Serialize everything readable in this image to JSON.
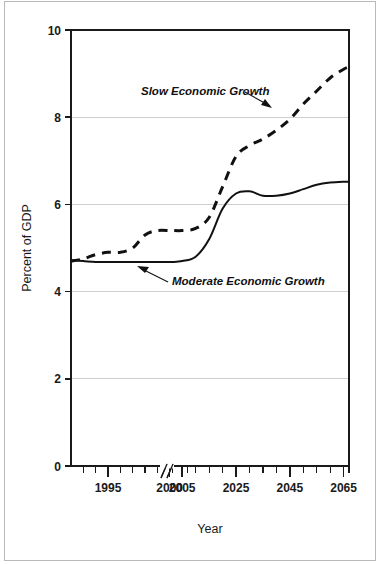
{
  "figure": {
    "background_color": "#ffffff",
    "frame_color": "#b9b9b9"
  },
  "chart_data": {
    "type": "line",
    "title": "",
    "subtitle": "",
    "xlabel": "Year",
    "ylabel": "Percent of GDP",
    "xlim": [
      1992,
      2067
    ],
    "ylim": [
      0,
      10
    ],
    "yticks": [
      0,
      2,
      4,
      6,
      8,
      10
    ],
    "ytick_labels": [
      "0",
      "2",
      "4",
      "6",
      "8",
      "10"
    ],
    "xtick_labels": [
      "1995",
      "2000",
      "2005",
      "2025",
      "2045",
      "2065"
    ],
    "xtick_values": [
      1995,
      2000,
      2005,
      2025,
      2045,
      2065
    ],
    "xtick_minor_values": [
      1993,
      1994,
      1996,
      1997,
      1998,
      1999,
      2001,
      2007,
      2010,
      2015,
      2020,
      2030,
      2035,
      2040,
      2050,
      2055,
      2060,
      2067
    ],
    "axis_break": {
      "present": true,
      "symbol": "//",
      "between": [
        2000,
        2005
      ],
      "note": "horizontal axis is compressed after 2005"
    },
    "grid": "horizontal-only",
    "gridlines_at": [
      2,
      4,
      6,
      8
    ],
    "legend_position": "inline-annotations",
    "series": [
      {
        "name": "Slow Economic Growth",
        "style": "dashed",
        "color": "#111111",
        "x": [
          1992,
          1993,
          1994,
          1995,
          1996,
          1997,
          1998,
          1999,
          2000,
          2001,
          2005,
          2010,
          2015,
          2020,
          2025,
          2030,
          2035,
          2040,
          2045,
          2050,
          2055,
          2060,
          2065,
          2067
        ],
        "values": [
          4.7,
          4.75,
          4.85,
          4.9,
          4.9,
          5.0,
          5.3,
          5.4,
          5.4,
          5.4,
          5.4,
          5.45,
          5.7,
          6.4,
          7.1,
          7.35,
          7.5,
          7.7,
          7.95,
          8.3,
          8.6,
          8.9,
          9.1,
          9.15
        ]
      },
      {
        "name": "Moderate Economic Growth",
        "style": "solid",
        "color": "#111111",
        "x": [
          1992,
          1993,
          1994,
          1995,
          1996,
          1997,
          1998,
          1999,
          2000,
          2001,
          2005,
          2010,
          2015,
          2020,
          2025,
          2030,
          2035,
          2040,
          2045,
          2050,
          2055,
          2060,
          2065,
          2067
        ],
        "values": [
          4.72,
          4.7,
          4.68,
          4.68,
          4.68,
          4.68,
          4.68,
          4.68,
          4.68,
          4.68,
          4.7,
          4.8,
          5.2,
          5.9,
          6.25,
          6.3,
          6.2,
          6.2,
          6.25,
          6.35,
          6.45,
          6.5,
          6.52,
          6.52
        ]
      }
    ],
    "annotations": [
      {
        "text": "Slow Economic Growth",
        "points_to_series": "Slow Economic Growth",
        "arrow": "down-right"
      },
      {
        "text": "Moderate Economic Growth",
        "points_to_series": "Moderate Economic Growth",
        "arrow": "up-left"
      }
    ]
  }
}
